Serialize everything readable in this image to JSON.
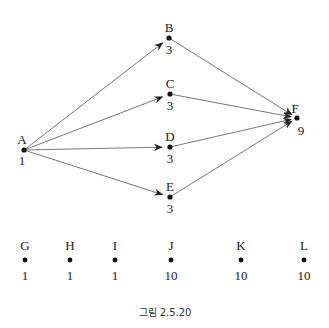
{
  "diagram": {
    "type": "directed-graph",
    "nodes": [
      {
        "id": "A",
        "label": "A",
        "value": "1",
        "x": 24,
        "y": 150
      },
      {
        "id": "B",
        "label": "B",
        "value": "3",
        "x": 169,
        "y": 38
      },
      {
        "id": "C",
        "label": "C",
        "value": "3",
        "x": 170,
        "y": 94
      },
      {
        "id": "D",
        "label": "D",
        "value": "3",
        "x": 170,
        "y": 147
      },
      {
        "id": "E",
        "label": "E",
        "value": "3",
        "x": 170,
        "y": 197
      },
      {
        "id": "F",
        "label": "F",
        "value": "9",
        "x": 297,
        "y": 118
      }
    ],
    "edges": [
      {
        "from": "A",
        "to": "B"
      },
      {
        "from": "A",
        "to": "C"
      },
      {
        "from": "A",
        "to": "D"
      },
      {
        "from": "A",
        "to": "E"
      },
      {
        "from": "B",
        "to": "F"
      },
      {
        "from": "C",
        "to": "F"
      },
      {
        "from": "D",
        "to": "F"
      },
      {
        "from": "E",
        "to": "F"
      }
    ],
    "isolated_nodes": [
      {
        "id": "G",
        "label": "G",
        "value": "1",
        "x": 25
      },
      {
        "id": "H",
        "label": "H",
        "value": "1",
        "x": 70
      },
      {
        "id": "I",
        "label": "I",
        "value": "1",
        "x": 115
      },
      {
        "id": "J",
        "label": "J",
        "value": "10",
        "x": 171
      },
      {
        "id": "K",
        "label": "K",
        "value": "10",
        "x": 241
      },
      {
        "id": "L",
        "label": "L",
        "value": "10",
        "x": 304
      }
    ],
    "caption": "그림 2.5.20"
  }
}
